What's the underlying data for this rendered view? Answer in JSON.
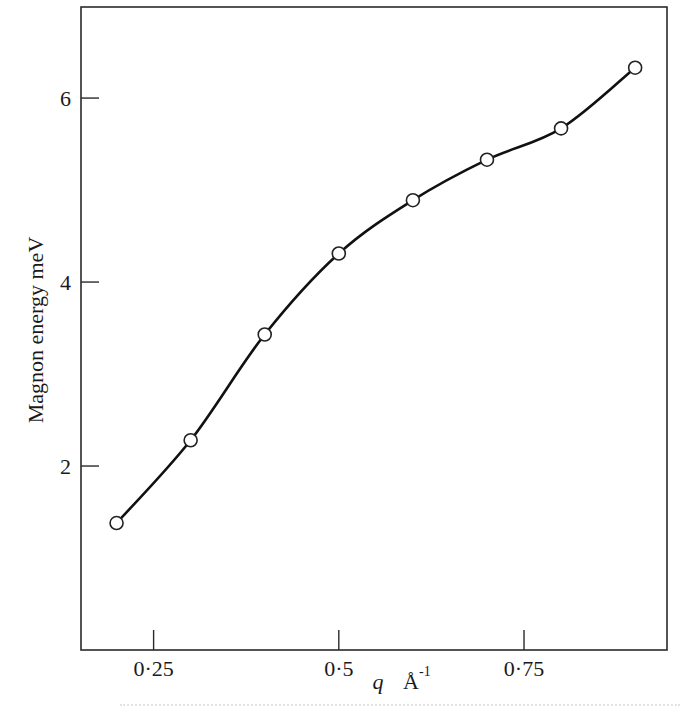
{
  "chart_data": {
    "type": "line",
    "title": "",
    "xlabel": "q  Å⁻¹",
    "xlabel_parts": {
      "var": "q",
      "unit": "Å",
      "exp": "-1"
    },
    "ylabel": "Magnon energy  meV",
    "x": [
      0.2,
      0.3,
      0.4,
      0.5,
      0.6,
      0.7,
      0.8,
      0.9
    ],
    "series": [
      {
        "name": "Magnon energy",
        "values": [
          1.38,
          2.28,
          3.43,
          4.31,
          4.89,
          5.33,
          5.67,
          6.33
        ],
        "marker": "open-circle",
        "line": "smooth"
      }
    ],
    "xlim": [
      0.152,
      0.943
    ],
    "ylim": [
      0,
      6.99
    ],
    "xticks": [
      0.25,
      0.5,
      0.75
    ],
    "xtick_labels": [
      "0·25",
      "0·5",
      "0·75"
    ],
    "yticks": [
      2,
      4,
      6
    ],
    "ytick_labels": [
      "2",
      "4",
      "6"
    ],
    "grid": false,
    "legend": null
  },
  "colors": {
    "line": "#111111",
    "marker_fill": "#ffffff",
    "frame": "#2a2a2a",
    "background": "#ffffff"
  }
}
